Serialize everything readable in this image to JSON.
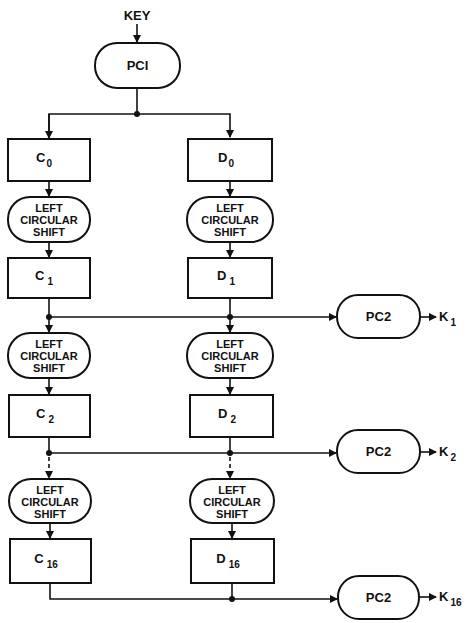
{
  "diagram": {
    "input_label": "KEY",
    "initial_permutation": "PCI",
    "shift_label": [
      "LEFT",
      "CIRCULAR",
      "SHIFT"
    ],
    "permutation_choice_2": "PC2",
    "colors": {
      "line": "#111111",
      "background": "#ffffff"
    },
    "rows": [
      {
        "c": {
          "base": "C",
          "sub": "0"
        },
        "d": {
          "base": "D",
          "sub": "0"
        }
      },
      {
        "c": {
          "base": "C",
          "sub": "1"
        },
        "d": {
          "base": "D",
          "sub": "1"
        },
        "k": {
          "base": "K",
          "sub": "1"
        }
      },
      {
        "c": {
          "base": "C",
          "sub": "2"
        },
        "d": {
          "base": "D",
          "sub": "2"
        },
        "k": {
          "base": "K",
          "sub": "2"
        }
      },
      {
        "c": {
          "base": "C",
          "sub": "16"
        },
        "d": {
          "base": "D",
          "sub": "16"
        },
        "k": {
          "base": "K",
          "sub": "16"
        }
      }
    ]
  }
}
